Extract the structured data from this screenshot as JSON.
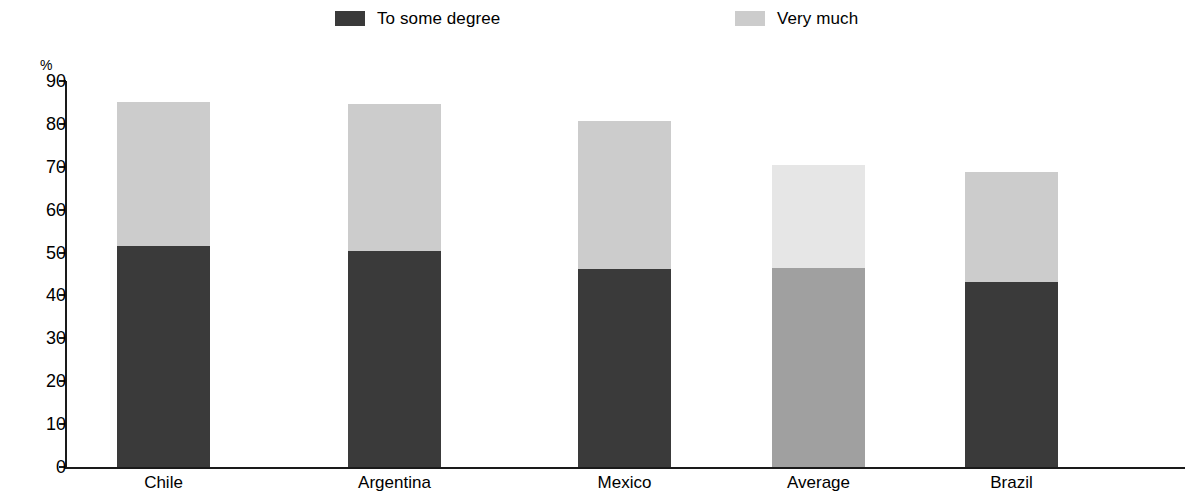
{
  "legend": {
    "entries": [
      {
        "label": "To some degree",
        "color": "#3a3a3a",
        "swatch_name": "legend-swatch-to-some-degree"
      },
      {
        "label": "Very much",
        "color": "#cccccc",
        "swatch_name": "legend-swatch-very-much"
      }
    ]
  },
  "axis": {
    "y_unit": "%",
    "y_ticks": [
      "90",
      "80",
      "70",
      "60",
      "50",
      "40",
      "30",
      "20",
      "10",
      "0"
    ]
  },
  "chart_data": {
    "type": "bar",
    "title": "",
    "subtitle": "",
    "xlabel": "",
    "ylabel": "%",
    "ylim": [
      0,
      90
    ],
    "grid": false,
    "stacked": true,
    "legend_position": "top",
    "categories": [
      "Chile",
      "Argentina",
      "Mexico",
      "Average",
      "Brazil"
    ],
    "series": [
      {
        "name": "To some degree",
        "values": [
          51.5,
          50.3,
          46.2,
          46.3,
          43.2
        ]
      },
      {
        "name": "Very much",
        "values": [
          33.5,
          34.4,
          34.5,
          24.0,
          25.5
        ]
      }
    ],
    "totals": [
      85.0,
      84.7,
      80.7,
      70.3,
      68.7
    ],
    "colors": {
      "to_some_degree": "#3a3a3a",
      "very_much": "#cccccc",
      "average_to_some_degree": "#a0a0a0",
      "average_very_much": "#e6e6e6"
    }
  },
  "bars": [
    {
      "category": "Chile",
      "left": 117,
      "width": 93,
      "bottom_value": 51.5,
      "top_value": 33.5,
      "total": 85.0,
      "bottom_color": "#3a3a3a",
      "top_color": "#cccccc"
    },
    {
      "category": "Argentina",
      "left": 348,
      "width": 93,
      "bottom_value": 50.3,
      "top_value": 34.4,
      "total": 84.7,
      "bottom_color": "#3a3a3a",
      "top_color": "#cccccc"
    },
    {
      "category": "Mexico",
      "left": 578,
      "width": 93,
      "bottom_value": 46.2,
      "top_value": 34.5,
      "total": 80.7,
      "bottom_color": "#3a3a3a",
      "top_color": "#cccccc"
    },
    {
      "category": "Average",
      "left": 772,
      "width": 93,
      "bottom_value": 46.3,
      "top_value": 24.0,
      "total": 70.3,
      "bottom_color": "#a0a0a0",
      "top_color": "#e6e6e6"
    },
    {
      "category": "Brazil",
      "left": 965,
      "width": 93,
      "bottom_value": 43.2,
      "top_value": 25.5,
      "total": 68.7,
      "bottom_color": "#3a3a3a",
      "top_color": "#cccccc"
    }
  ],
  "geometry": {
    "baseline_y": 467,
    "px_per_unit": 4.289
  }
}
